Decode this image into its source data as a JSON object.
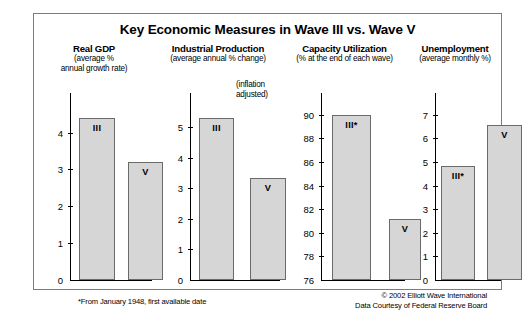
{
  "figure": {
    "title": "Key Economic Measures in Wave III vs. Wave V",
    "footnote": "*From January 1948, first available date",
    "credit_line1": "© 2002 Elliott Wave International",
    "credit_line2": "Data Courtesy of Federal Reserve Board",
    "frame_color": "#7c7c7c",
    "bar_fill": "#d6d6d6",
    "bar_stroke": "#6a6a6a"
  },
  "panels": [
    {
      "key": "real-gdp",
      "title": "Real GDP",
      "sub_line1": "(average %",
      "sub_line2": "annual growth rate)",
      "annotation": "",
      "ticks": [
        "0",
        "1",
        "2",
        "3",
        "4"
      ],
      "bars": [
        {
          "label": "III",
          "value": 4.4
        },
        {
          "label": "V",
          "value": 3.2
        }
      ]
    },
    {
      "key": "industrial-production",
      "title": "Industrial Production",
      "sub_line1": "(average annual % change)",
      "sub_line2": "",
      "annotation": "(inflation\nadjusted)",
      "ticks": [
        "0",
        "1",
        "2",
        "3",
        "4",
        "5"
      ],
      "bars": [
        {
          "label": "III",
          "value": 5.3
        },
        {
          "label": "V",
          "value": 3.35
        }
      ]
    },
    {
      "key": "capacity-utilization",
      "title": "Capacity Utilization",
      "sub_line1": "(% at the end of each wave)",
      "sub_line2": "",
      "annotation": "",
      "ticks": [
        "76",
        "78",
        "80",
        "82",
        "84",
        "86",
        "88",
        "90"
      ],
      "bars": [
        {
          "label": "III*",
          "value": 90.0
        },
        {
          "label": "V",
          "value": 81.2
        }
      ]
    },
    {
      "key": "unemployment",
      "title": "Unemployment",
      "sub_line1": "(average monthly %)",
      "sub_line2": "",
      "annotation": "",
      "ticks": [
        "0",
        "1",
        "2",
        "3",
        "4",
        "5",
        "6",
        "7"
      ],
      "bars": [
        {
          "label": "III*",
          "value": 4.85
        },
        {
          "label": "V",
          "value": 6.55
        }
      ]
    }
  ],
  "chart_data": {
    "type": "bar",
    "title": "Key Economic Measures in Wave III vs. Wave V",
    "categories": [
      "Wave III",
      "Wave V"
    ],
    "panels": [
      {
        "name": "Real GDP",
        "ylabel": "average % annual growth rate",
        "ylim": [
          0,
          4.8
        ],
        "yticks": [
          0,
          1,
          2,
          3,
          4
        ],
        "values": [
          4.4,
          3.2
        ],
        "bar_labels": [
          "III",
          "V"
        ],
        "grid": false
      },
      {
        "name": "Industrial Production",
        "ylabel": "average annual % change (inflation adjusted)",
        "ylim": [
          0,
          5.8
        ],
        "yticks": [
          0,
          1,
          2,
          3,
          4,
          5
        ],
        "values": [
          5.3,
          3.35
        ],
        "bar_labels": [
          "III",
          "V"
        ],
        "grid": false
      },
      {
        "name": "Capacity Utilization",
        "ylabel": "% at the end of each wave",
        "ylim": [
          76,
          91
        ],
        "yticks": [
          76,
          78,
          80,
          82,
          84,
          86,
          88,
          90
        ],
        "values": [
          90.0,
          81.2
        ],
        "bar_labels": [
          "III*",
          "V"
        ],
        "grid": false
      },
      {
        "name": "Unemployment",
        "ylabel": "average monthly %",
        "ylim": [
          0,
          7.5
        ],
        "yticks": [
          0,
          1,
          2,
          3,
          4,
          5,
          6,
          7
        ],
        "values": [
          4.85,
          6.55
        ],
        "bar_labels": [
          "III*",
          "V"
        ],
        "grid": false
      }
    ],
    "annotations": [
      "*From January 1948, first available date",
      "© 2002 Elliott Wave International",
      "Data Courtesy of Federal Reserve Board"
    ],
    "legend": [],
    "xlabel": "",
    "ylabel": ""
  }
}
